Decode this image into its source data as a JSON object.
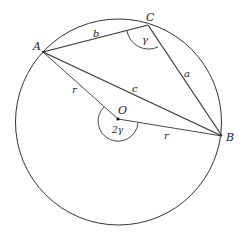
{
  "diagram": {
    "points": {
      "A": {
        "label": "A"
      },
      "B": {
        "label": "B"
      },
      "C": {
        "label": "C"
      },
      "O": {
        "label": "O"
      }
    },
    "sides": {
      "a": "a",
      "b": "b",
      "c": "c",
      "r1": "r",
      "r2": "r"
    },
    "angles": {
      "inscribed": "γ",
      "central": "2γ"
    },
    "colors": {
      "stroke": "#333333",
      "background": "#ffffff"
    }
  }
}
